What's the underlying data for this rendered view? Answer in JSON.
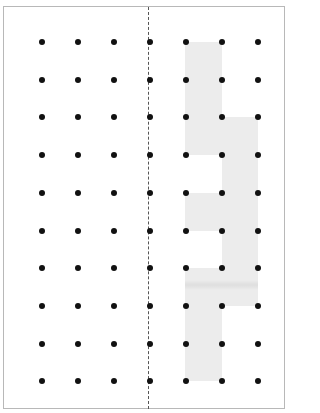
{
  "diagram": {
    "type": "dot-grid-polyomino",
    "grid": {
      "columns_x": [
        42,
        78,
        114,
        150,
        186,
        222,
        258
      ],
      "rows_y": [
        42,
        80,
        117,
        155,
        193,
        231,
        268,
        306,
        344,
        381
      ],
      "dot_color": "#111111"
    },
    "divider": {
      "style": "dashed",
      "x": 148
    },
    "shaded_region": {
      "fill": "#ececec",
      "cells": [
        {
          "x": 185,
          "y": 42,
          "w": 37,
          "h": 113
        },
        {
          "x": 222,
          "y": 117,
          "w": 36,
          "h": 189
        },
        {
          "x": 185,
          "y": 193,
          "w": 37,
          "h": 38
        },
        {
          "x": 185,
          "y": 268,
          "w": 37,
          "h": 113
        }
      ]
    }
  }
}
